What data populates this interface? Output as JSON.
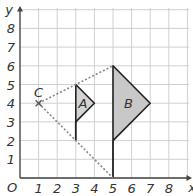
{
  "diagram": {
    "type": "coordinate-grid-enlargement",
    "axes": {
      "x_label": "x",
      "y_label": "y",
      "origin_label": "O",
      "x_ticks": [
        "1",
        "2",
        "3",
        "4",
        "5",
        "6",
        "7",
        "8"
      ],
      "y_ticks": [
        "1",
        "2",
        "3",
        "4",
        "5",
        "6",
        "7",
        "8"
      ],
      "x_range": [
        0,
        9
      ],
      "y_range": [
        0,
        9
      ]
    },
    "center": {
      "label": "C",
      "x": 1,
      "y": 4
    },
    "shapes": [
      {
        "label": "A",
        "vertices": [
          [
            3,
            5
          ],
          [
            4,
            4
          ],
          [
            3,
            3
          ]
        ],
        "fill": "#d4d4d4"
      },
      {
        "label": "B",
        "vertices": [
          [
            5,
            6
          ],
          [
            7,
            4
          ],
          [
            5,
            2
          ]
        ],
        "fill": "#c8c8c8"
      }
    ],
    "dashed_rays": [
      {
        "from": [
          1,
          4
        ],
        "to": [
          5,
          6
        ]
      },
      {
        "from": [
          1,
          4
        ],
        "to": [
          5,
          0
        ]
      }
    ],
    "extra_lines": [
      {
        "from": [
          3,
          3
        ],
        "to": [
          3,
          2
        ]
      },
      {
        "from": [
          5,
          2
        ],
        "to": [
          5,
          0
        ]
      }
    ]
  }
}
